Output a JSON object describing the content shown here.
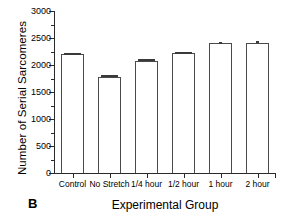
{
  "panel": {
    "letter": "B"
  },
  "chart_data": {
    "type": "bar",
    "title": "",
    "xlabel": "Experimental Group",
    "ylabel": "Number of Serial Sarcomeres",
    "categories": [
      "Control",
      "No Stretch",
      "1/4 hour",
      "1/2 hour",
      "1 hour",
      "2 hour"
    ],
    "values": [
      2200,
      1780,
      2080,
      2220,
      2400,
      2400
    ],
    "errors": [
      30,
      30,
      30,
      30,
      35,
      40
    ],
    "ylim": [
      0,
      3000
    ],
    "ytick_labels": [
      "0",
      "500",
      "1000",
      "1500",
      "2000",
      "2500",
      "3000"
    ],
    "ytick_values": [
      0,
      500,
      1000,
      1500,
      2000,
      2500,
      3000
    ],
    "yminor_values": [
      250,
      750,
      1250,
      1750,
      2250,
      2750
    ],
    "grid": false,
    "legend": false,
    "bar_fill": "#ffffff",
    "bar_edge": "#4a4a4a",
    "axis_color": "#2a2a2a"
  }
}
